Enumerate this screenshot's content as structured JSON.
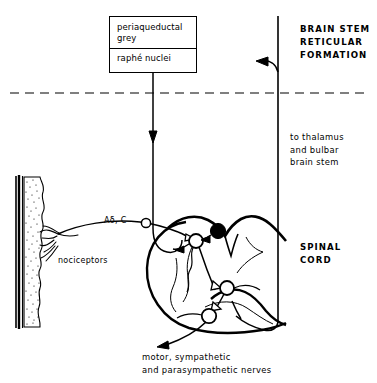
{
  "figure": {
    "title_box": {
      "line1": "periaqueductal",
      "line2": "grey",
      "line3": "raphé nuclei"
    },
    "regions": {
      "brainstem": "BRAIN STEM\nRETICULAR\nFORMATION",
      "spinal_cord": "SPINAL\nCORD"
    },
    "pathways": {
      "ascending": "to thalamus\nand bulbar\nbrain stem",
      "efferent": "motor, sympathetic\nand parasympathetic nerves"
    },
    "afferents": {
      "fiber_types": "Aδ, C",
      "receptors": "nociceptors"
    },
    "colors": {
      "ink": "#000000",
      "background": "#ffffff",
      "inhibitory_neuron": "#000000",
      "excitatory_neuron": "#ffffff"
    }
  }
}
